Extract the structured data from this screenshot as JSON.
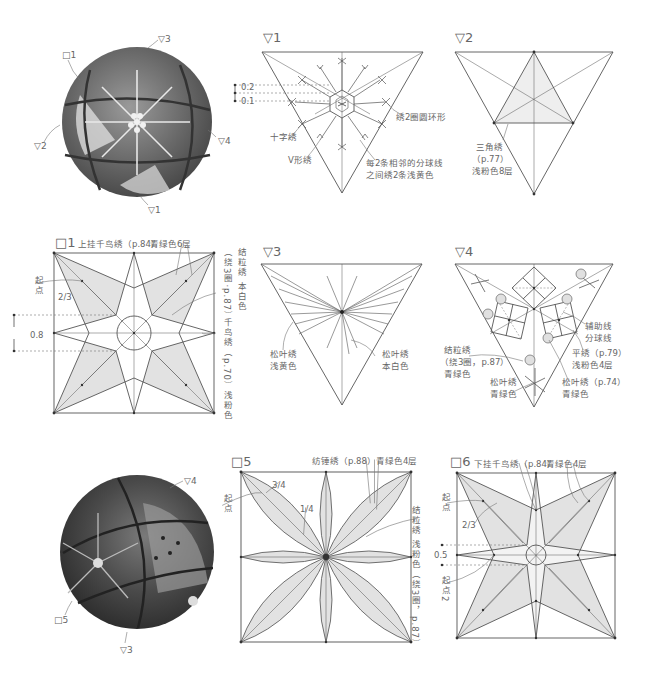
{
  "ball_top": {
    "labels": [
      "□1",
      "▽3",
      "▽2",
      "▽4",
      "▽1"
    ]
  },
  "tri1": {
    "title": "▽1",
    "dim_02": "0.2",
    "dim_01": "0.1",
    "label_ring": "绣2圈圆环形",
    "label_cross": "十字绣",
    "label_v": "V形绣",
    "label_between_l1": "每2条相邻的分球线",
    "label_between_l2": "之间绣2条浅黄色"
  },
  "tri2": {
    "title": "▽2",
    "label_l1": "三角绣",
    "label_l2": "（p.77）",
    "label_l3": "浅粉色8层"
  },
  "sq1": {
    "title": "□1",
    "top_label": "上挂千鸟绣（p.84）",
    "top_color": "青绿色6层",
    "start_point": "起点",
    "ratio": "2/3",
    "dim": "0.8",
    "right_v1": "结粒绣 本白色",
    "right_v2": "（绕3圈·p.87）",
    "right_v3": "千鸟绣（p.70）浅粉色"
  },
  "tri3": {
    "title": "▽3",
    "left_l1": "松叶绣",
    "left_l2": "浅黄色",
    "right_l1": "松叶绣",
    "right_l2": "本白色"
  },
  "tri4": {
    "title": "▽4",
    "aux_l1": "辅助线",
    "aux_l2": "分球线",
    "flat_l1": "平绣（p.79）",
    "flat_l2": "浅粉色4层",
    "knot_l1": "结粒绣",
    "knot_l2": "（绕3圈，p.87）",
    "knot_l3": "青绿色",
    "pine_l1": "松叶绣",
    "pine_l2": "青绿色",
    "pine2_l1": "松叶绣（p.74）",
    "pine2_l2": "青绿色"
  },
  "ball_bottom": {
    "labels": [
      "▽4",
      "□5",
      "▽3"
    ]
  },
  "sq5": {
    "title": "□5",
    "top_label": "纺锤绣（p.88）青绿色4层",
    "start_point": "起点",
    "ratio_34": "3/4",
    "ratio_14": "1/4",
    "right_v": "结粒绣 浅粉色（绕3圈，p.87）"
  },
  "sq6": {
    "title": "□6",
    "top_label": "下挂千鸟绣（p.84）",
    "top_color": "青绿色4层",
    "start_point": "起点",
    "ratio": "2/3",
    "dim": "0.5",
    "start_point2": "起点2"
  },
  "colors": {
    "line": "#555555",
    "fill": "#e4e4e4",
    "text": "#666666"
  }
}
